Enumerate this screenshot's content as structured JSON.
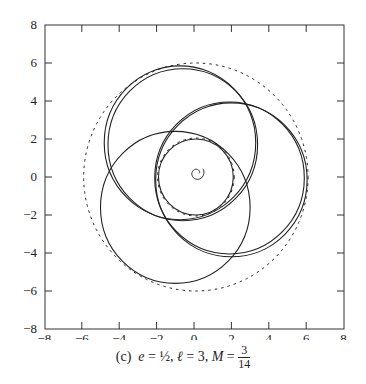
{
  "chart_data": {
    "type": "line",
    "title": "",
    "caption": {
      "label": "(c)",
      "e": "½",
      "l": "3",
      "M_num": "3",
      "M_den": "14"
    },
    "xlabel": "",
    "ylabel": "",
    "xlim": [
      -8,
      8
    ],
    "ylim": [
      -8,
      8
    ],
    "xticks": [
      "-8",
      "-6",
      "-4",
      "-2",
      "0",
      "2",
      "4",
      "6",
      "8"
    ],
    "yticks": [
      "8",
      "6",
      "4",
      "2",
      "0",
      "-2",
      "-4",
      "-6",
      "-8"
    ],
    "grid": false,
    "legend": "none",
    "series": [
      {
        "name": "orbit-loop-upper",
        "style": "solid",
        "center": [
          -0.75,
          1.8
        ],
        "radius": 4.05
      },
      {
        "name": "orbit-loop-upper-2",
        "style": "solid",
        "center": [
          -0.6,
          1.7
        ],
        "radius": 4.0
      },
      {
        "name": "orbit-loop-lower-left",
        "style": "solid",
        "center": [
          -1.0,
          -1.6
        ],
        "radius": 4.0
      },
      {
        "name": "orbit-loop-right",
        "style": "solid",
        "center": [
          2.0,
          -0.15
        ],
        "radius": 4.05
      },
      {
        "name": "orbit-loop-right-2",
        "style": "solid",
        "center": [
          1.9,
          -0.05
        ],
        "radius": 4.0
      },
      {
        "name": "orbit-inner",
        "style": "solid",
        "center": [
          0.1,
          0.0
        ],
        "radius": 2.0
      },
      {
        "name": "horizon-outer",
        "style": "dashed",
        "center": [
          0.1,
          0.0
        ],
        "radius": 6.0
      },
      {
        "name": "horizon-inner",
        "style": "dashed",
        "center": [
          0.1,
          0.0
        ],
        "radius": 2.05
      }
    ]
  }
}
